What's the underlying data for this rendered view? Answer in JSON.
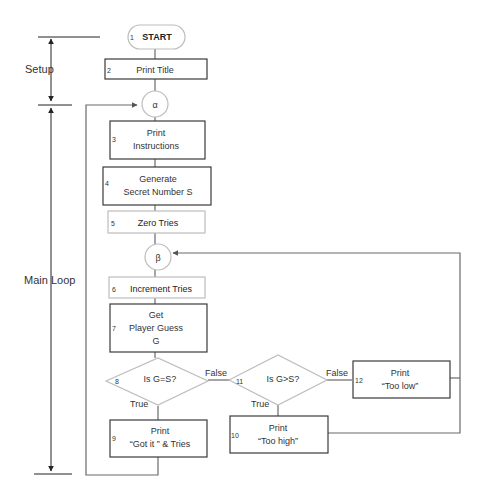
{
  "sections": {
    "setup": "Setup",
    "main_loop": "Main Loop"
  },
  "nodes": {
    "n1": {
      "num": "1",
      "label": "START",
      "shape": "terminator"
    },
    "n2": {
      "num": "2",
      "label": "Print Title",
      "shape": "process"
    },
    "alpha": {
      "label": "α",
      "shape": "connector"
    },
    "n3": {
      "num": "3",
      "line1": "Print",
      "line2": "Instructions",
      "shape": "process"
    },
    "n4": {
      "num": "4",
      "line1": "Generate",
      "line2": "Secret Number S",
      "shape": "process"
    },
    "n5": {
      "num": "5",
      "label": "Zero Tries",
      "shape": "process"
    },
    "beta": {
      "label": "β",
      "shape": "connector"
    },
    "n6": {
      "num": "6",
      "label": "Increment Tries",
      "shape": "process"
    },
    "n7": {
      "num": "7",
      "line1": "Get",
      "line2": "Player Guess",
      "line3": "G",
      "shape": "process"
    },
    "n8": {
      "num": "8",
      "label": "Is G=S?",
      "shape": "decision"
    },
    "n9": {
      "num": "9",
      "line1": "Print",
      "line2": "“Got it ” & Tries",
      "shape": "process"
    },
    "n10": {
      "num": "10",
      "line1": "Print",
      "line2": "“Too high”",
      "shape": "process"
    },
    "n11": {
      "num": "11",
      "label": "Is G>S?",
      "shape": "decision"
    },
    "n12": {
      "num": "12",
      "line1": "Print",
      "line2": "“Too low”",
      "shape": "process"
    }
  },
  "edges": {
    "n8_false": "False",
    "n8_true": "True",
    "n11_false": "False",
    "n11_true": "True"
  }
}
